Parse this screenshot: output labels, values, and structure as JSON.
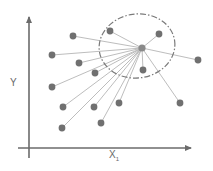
{
  "diagram": {
    "type": "knn-neighborhood",
    "axes": {
      "x_label": "X",
      "x_label_sub": "1",
      "y_label": "Y"
    },
    "colors": {
      "axis": "#6b6b6b",
      "point": "#707070",
      "line": "#b5b5b5",
      "ellipse": "#7a7a7a",
      "center": "#8a8a8a"
    },
    "center": {
      "x": 142,
      "y": 48
    },
    "neighborhood_ellipse": {
      "cx": 137,
      "cy": 46,
      "rx": 38,
      "ry": 32,
      "style": "dash-dot"
    },
    "points": [
      {
        "x": 110,
        "y": 31
      },
      {
        "x": 159,
        "y": 34
      },
      {
        "x": 73,
        "y": 36
      },
      {
        "x": 52,
        "y": 55
      },
      {
        "x": 198,
        "y": 60
      },
      {
        "x": 79,
        "y": 63
      },
      {
        "x": 143,
        "y": 70
      },
      {
        "x": 95,
        "y": 73
      },
      {
        "x": 52,
        "y": 87
      },
      {
        "x": 63,
        "y": 107
      },
      {
        "x": 94,
        "y": 107
      },
      {
        "x": 119,
        "y": 103
      },
      {
        "x": 180,
        "y": 103
      },
      {
        "x": 62,
        "y": 128
      },
      {
        "x": 101,
        "y": 123
      }
    ]
  }
}
